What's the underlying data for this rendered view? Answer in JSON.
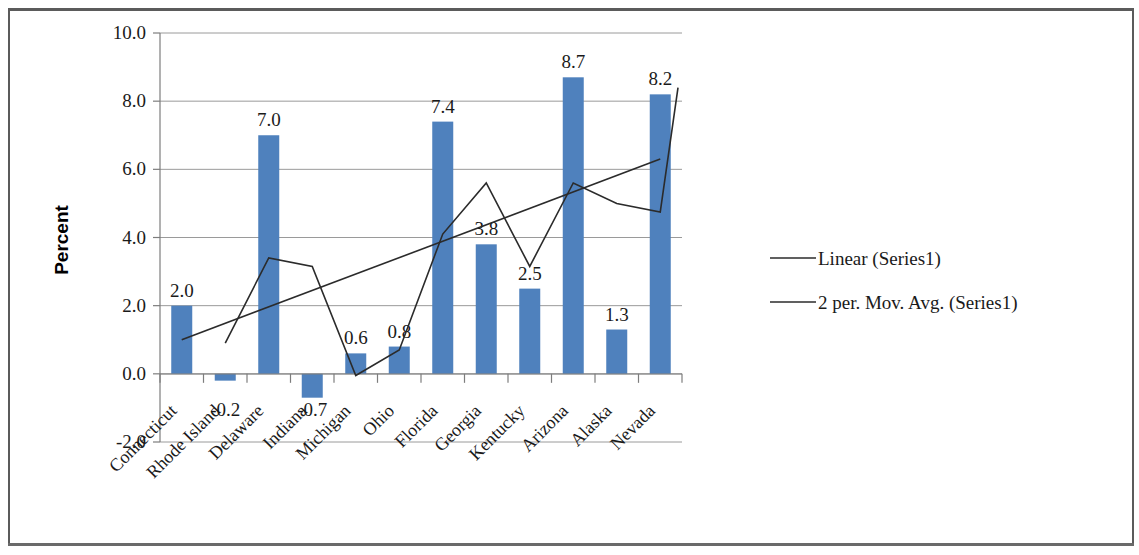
{
  "chart_data": {
    "type": "bar",
    "title": "",
    "xlabel": "",
    "ylabel": "Percent",
    "ylim": [
      -2.0,
      10.0
    ],
    "ytick_step": 2.0,
    "ytick_labels": [
      "10.0",
      "8.0",
      "6.0",
      "4.0",
      "2.0",
      "0.0",
      "-2.0"
    ],
    "ytick_values": [
      10.0,
      8.0,
      6.0,
      4.0,
      2.0,
      0.0,
      -2.0
    ],
    "grid": true,
    "legend_position": "right",
    "categories": [
      "Connecticut",
      "Rhode Island",
      "Delaware",
      "Indiana",
      "Michigan",
      "Ohio",
      "Florida",
      "Georgia",
      "Kentucky",
      "Arizona",
      "Alaska",
      "Nevada"
    ],
    "values": [
      2.0,
      -0.2,
      7.0,
      -0.7,
      0.6,
      0.8,
      7.4,
      3.8,
      2.5,
      8.7,
      1.3,
      8.2
    ],
    "data_labels": [
      "2.0",
      "-0.2",
      "7.0",
      "-0.7",
      "0.6",
      "0.8",
      "7.4",
      "3.8",
      "2.5",
      "8.7",
      "1.3",
      "8.2"
    ],
    "bar_color": "#4F81BD",
    "series": [
      {
        "name": "Series1",
        "type": "bar",
        "values": [
          2.0,
          -0.2,
          7.0,
          -0.7,
          0.6,
          0.8,
          7.4,
          3.8,
          2.5,
          8.7,
          1.3,
          8.2
        ]
      },
      {
        "name": "Linear (Series1)",
        "type": "line",
        "line_color": "#2b2b2b",
        "endpoints": [
          1.0,
          6.3
        ]
      },
      {
        "name": "2 per. Mov. Avg. (Series1)",
        "type": "line",
        "line_color": "#2b2b2b",
        "values": [
          null,
          0.9,
          3.4,
          3.15,
          -0.05,
          0.7,
          4.1,
          5.6,
          3.15,
          5.6,
          5.0,
          4.75
        ],
        "final_point": 8.4
      }
    ]
  },
  "axis": {
    "y_title": "Percent",
    "y_labels": [
      "10.0",
      "8.0",
      "6.0",
      "4.0",
      "2.0",
      "0.0",
      "-2.0"
    ],
    "x_labels": [
      "Connecticut",
      "Rhode Island",
      "Delaware",
      "Indiana",
      "Michigan",
      "Ohio",
      "Florida",
      "Georgia",
      "Kentucky",
      "Arizona",
      "Alaska",
      "Nevada"
    ]
  },
  "bar_labels": [
    "2.0",
    "-0.2",
    "7.0",
    "-0.7",
    "0.6",
    "0.8",
    "7.4",
    "3.8",
    "2.5",
    "8.7",
    "1.3",
    "8.2"
  ],
  "legend": {
    "items": [
      {
        "label": "Linear (Series1)"
      },
      {
        "label": "2 per. Mov. Avg. (Series1)"
      }
    ]
  },
  "colors": {
    "bar": "#4F81BD",
    "line": "#2b2b2b",
    "grid": "#9a9a9a",
    "text": "#1a1a1a"
  }
}
